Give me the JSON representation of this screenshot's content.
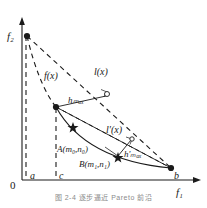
{
  "figure": {
    "axes": {
      "origin_label": "0",
      "x_axis_label": "f₁",
      "y_axis_label": "f₂"
    },
    "tick_labels": [
      {
        "name": "tick-a",
        "text": "a"
      },
      {
        "name": "tick-c",
        "text": "c"
      },
      {
        "name": "tick-b",
        "text": "b"
      }
    ],
    "curve_labels": [
      {
        "name": "curve-f",
        "text": "f(x)"
      },
      {
        "name": "line-l",
        "text": "l(x)"
      },
      {
        "name": "line-l-prime",
        "text": "l′(x)"
      }
    ],
    "point_labels": [
      {
        "name": "point-A",
        "text": "A(m₀,n₀)"
      },
      {
        "name": "point-B",
        "text": "B(m₁,n₁)"
      }
    ],
    "distance_labels": [
      {
        "name": "h-max",
        "text": "hₘₐₓ"
      },
      {
        "name": "h-max-prime",
        "text": "h′ₘₐₓ"
      }
    ],
    "colors": {
      "stroke": "#1a1a1a",
      "background": "#ffffff",
      "caption": "#8a8a8a"
    },
    "caption": "图 2-4   逐步逼近 Pareto 前沿"
  }
}
